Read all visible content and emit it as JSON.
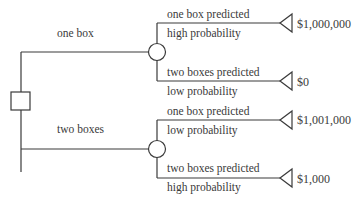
{
  "diagram": {
    "type": "decision-tree",
    "decision_node": {
      "shape": "square"
    },
    "branches": [
      {
        "choice": "one box",
        "outcomes": [
          {
            "prediction": "one box predicted",
            "probability": "high probability",
            "payoff": "$1,000,000"
          },
          {
            "prediction": "two boxes predicted",
            "probability": "low probability",
            "payoff": "$0"
          }
        ]
      },
      {
        "choice": "two boxes",
        "outcomes": [
          {
            "prediction": "one box predicted",
            "probability": "low probability",
            "payoff": "$1,001,000"
          },
          {
            "prediction": "two boxes predicted",
            "probability": "high probability",
            "payoff": "$1,000"
          }
        ]
      }
    ]
  }
}
